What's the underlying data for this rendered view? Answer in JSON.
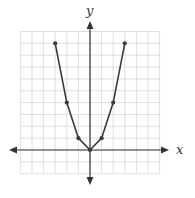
{
  "chart_data": {
    "type": "line",
    "title": "",
    "xlabel": "x",
    "ylabel": "y",
    "xlim": [
      -6,
      6
    ],
    "ylim": [
      -2,
      10
    ],
    "grid": true,
    "tick_labels": false,
    "series": [
      {
        "name": "y = x^2",
        "x": [
          -3,
          -2,
          -1,
          0,
          1,
          2,
          3
        ],
        "y": [
          9,
          4,
          1,
          0,
          1,
          4,
          9
        ],
        "markers": true
      }
    ]
  },
  "colors": {
    "grid": "#d8d8d8",
    "axis": "#333333",
    "curve": "#3a3a3a"
  }
}
